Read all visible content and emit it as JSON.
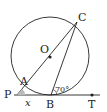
{
  "diagram": {
    "type": "circle-tangent-geometry",
    "points": {
      "C": {
        "label": "C"
      },
      "O": {
        "label": "O"
      },
      "A": {
        "label": "A"
      },
      "P": {
        "label": "P"
      },
      "B": {
        "label": "B"
      },
      "T": {
        "label": "T"
      }
    },
    "angles": {
      "given": {
        "label": "70°"
      },
      "unknown": {
        "label": "x"
      }
    },
    "colors": {
      "stroke": "#222222",
      "angle_fill": "#bbbbbb"
    }
  }
}
